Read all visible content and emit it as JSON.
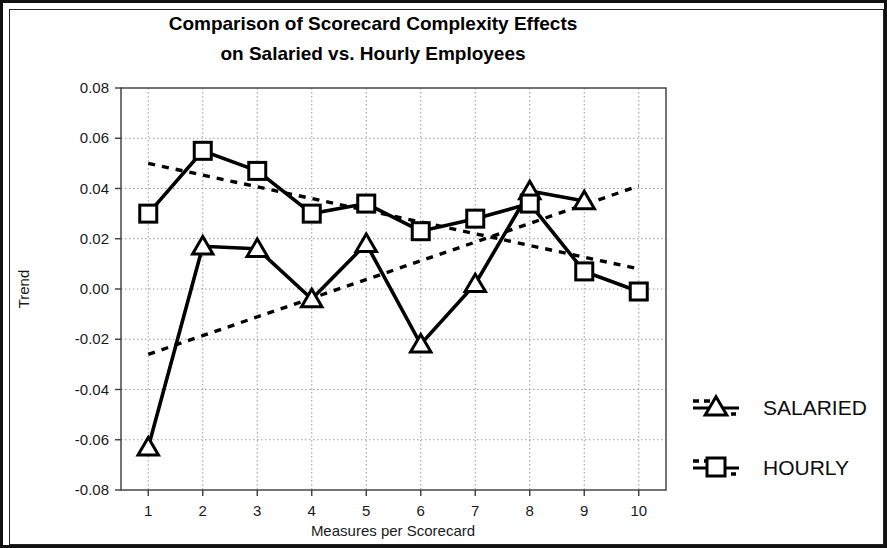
{
  "chart_data": {
    "type": "line",
    "title": "Comparison of Scorecard Complexity Effects on Salaried vs. Hourly Employees",
    "title_line1": "Comparison of Scorecard Complexity Effects",
    "title_line2": "on Salaried vs. Hourly Employees",
    "xlabel": "Measures per Scorecard",
    "ylabel": "Trend",
    "x": [
      1,
      2,
      3,
      4,
      5,
      6,
      7,
      8,
      9,
      10
    ],
    "xtick_labels": [
      "1",
      "2",
      "3",
      "4",
      "5",
      "6",
      "7",
      "8",
      "9",
      "10"
    ],
    "ytick_labels": [
      "0.08",
      "0.06",
      "0.04",
      "0.02",
      "0.00",
      "-0.02",
      "-0.04",
      "-0.06",
      "-0.08"
    ],
    "ytick_values": [
      0.08,
      0.06,
      0.04,
      0.02,
      0.0,
      -0.02,
      -0.04,
      -0.06,
      -0.08
    ],
    "xlim": [
      0.5,
      10.5
    ],
    "ylim": [
      -0.08,
      0.08
    ],
    "grid": true,
    "grid_style": "dotted",
    "legend_position": "right",
    "series": [
      {
        "name": "SALARIED",
        "marker": "triangle",
        "style": "solid",
        "color": "#000000",
        "x": [
          1,
          2,
          3,
          4,
          5,
          6,
          7,
          8,
          9
        ],
        "values": [
          -0.063,
          0.017,
          0.016,
          -0.004,
          0.018,
          -0.022,
          0.002,
          0.039,
          0.035
        ]
      },
      {
        "name": "HOURLY",
        "marker": "square",
        "style": "solid",
        "color": "#000000",
        "x": [
          1,
          2,
          3,
          4,
          5,
          6,
          7,
          8,
          9,
          10
        ],
        "values": [
          0.03,
          0.055,
          0.047,
          0.03,
          0.034,
          0.023,
          0.028,
          0.034,
          0.007,
          -0.001
        ]
      }
    ],
    "trendlines": [
      {
        "name": "SALARIED trend",
        "for_series": "SALARIED",
        "style": "dotted",
        "color": "#000000",
        "x_start": 1,
        "y_start": -0.026,
        "x_end": 10,
        "y_end": 0.041
      },
      {
        "name": "HOURLY trend",
        "for_series": "HOURLY",
        "style": "dotted",
        "color": "#000000",
        "x_start": 1,
        "y_start": 0.05,
        "x_end": 10,
        "y_end": 0.008
      }
    ],
    "legend": [
      {
        "label": "SALARIED",
        "marker": "triangle"
      },
      {
        "label": "HOURLY",
        "marker": "square"
      }
    ]
  }
}
